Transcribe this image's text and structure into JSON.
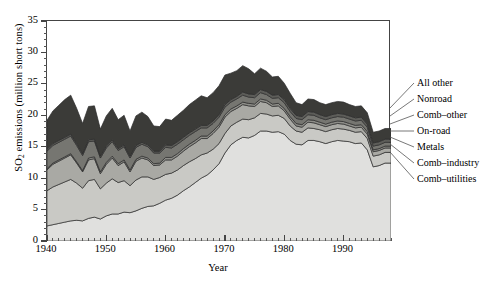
{
  "chart_data": {
    "type": "area",
    "stacked": true,
    "title": "",
    "xlabel": "Year",
    "ylabel": "SO2 emissions (million short tons)",
    "ylabel_display": "SO₂ emissions (million short tons)",
    "xlim": [
      1940,
      1998
    ],
    "ylim": [
      0,
      35
    ],
    "ytick_values": [
      0,
      5,
      10,
      15,
      20,
      25,
      30,
      35
    ],
    "ytick_labels": [
      "0",
      "5",
      "10",
      "15",
      "20",
      "25",
      "30",
      "35"
    ],
    "ytick_minor_step": 1,
    "xtick_values": [
      1940,
      1950,
      1960,
      1970,
      1980,
      1990
    ],
    "xtick_labels": [
      "1940",
      "1950",
      "1960",
      "1970",
      "1980",
      "1990"
    ],
    "xtick_minor_step": 1,
    "grid": false,
    "legend_position": "right-leader-lines",
    "x": [
      1940,
      1941,
      1942,
      1943,
      1944,
      1945,
      1946,
      1947,
      1948,
      1949,
      1950,
      1951,
      1952,
      1953,
      1954,
      1955,
      1956,
      1957,
      1958,
      1959,
      1960,
      1961,
      1962,
      1963,
      1964,
      1965,
      1966,
      1967,
      1968,
      1969,
      1970,
      1971,
      1972,
      1973,
      1974,
      1975,
      1976,
      1977,
      1978,
      1979,
      1980,
      1981,
      1982,
      1983,
      1984,
      1985,
      1986,
      1987,
      1988,
      1989,
      1990,
      1991,
      1992,
      1993,
      1994,
      1995,
      1996,
      1997,
      1998
    ],
    "series": [
      {
        "name": "Comb-utilities",
        "label": "Comb–utilities",
        "color": "#e0e0de",
        "values": [
          2.4,
          2.6,
          2.8,
          3.0,
          3.2,
          3.3,
          3.2,
          3.6,
          3.8,
          3.5,
          4.0,
          4.3,
          4.3,
          4.6,
          4.5,
          4.8,
          5.2,
          5.5,
          5.6,
          6.0,
          6.5,
          6.8,
          7.3,
          8.0,
          8.6,
          9.3,
          10.0,
          10.5,
          11.3,
          12.3,
          14.0,
          15.3,
          16.0,
          16.5,
          16.4,
          16.8,
          17.5,
          17.5,
          17.3,
          17.4,
          17.0,
          16.0,
          15.4,
          15.3,
          16.0,
          16.0,
          15.8,
          15.5,
          15.8,
          16.0,
          15.9,
          15.8,
          15.5,
          15.6,
          14.5,
          11.8,
          12.0,
          12.4,
          12.4
        ]
      },
      {
        "name": "Comb-industry",
        "label": "Comb–industry",
        "color": "#c9c9c5",
        "values": [
          5.6,
          6.0,
          6.2,
          6.4,
          6.6,
          5.9,
          5.2,
          6.0,
          6.0,
          4.8,
          5.2,
          5.6,
          5.0,
          5.0,
          4.3,
          4.9,
          5.0,
          4.7,
          4.2,
          4.1,
          4.1,
          4.0,
          4.0,
          4.0,
          4.0,
          3.8,
          3.7,
          3.5,
          3.3,
          3.2,
          3.1,
          3.0,
          2.9,
          2.9,
          2.9,
          2.8,
          2.8,
          2.7,
          2.6,
          2.6,
          2.5,
          2.3,
          2.1,
          2.0,
          2.0,
          1.9,
          1.9,
          1.9,
          1.9,
          1.9,
          1.9,
          1.8,
          1.8,
          1.8,
          1.8,
          1.7,
          1.7,
          1.7,
          1.7
        ]
      },
      {
        "name": "Metals",
        "label": "Metals",
        "color": "#a9a9a4",
        "values": [
          3.3,
          3.6,
          3.7,
          3.8,
          3.9,
          3.2,
          2.6,
          3.3,
          3.3,
          2.4,
          3.0,
          3.3,
          2.7,
          3.0,
          2.2,
          3.0,
          3.0,
          2.7,
          2.2,
          2.0,
          2.3,
          2.1,
          2.2,
          2.3,
          2.4,
          2.5,
          2.6,
          2.3,
          2.5,
          2.6,
          2.6,
          2.3,
          2.2,
          2.3,
          2.2,
          1.8,
          1.9,
          1.8,
          1.5,
          1.5,
          1.2,
          1.1,
          0.8,
          0.8,
          0.9,
          0.9,
          0.8,
          0.8,
          0.8,
          0.8,
          0.8,
          0.7,
          0.7,
          0.7,
          0.7,
          0.7,
          0.7,
          0.7,
          0.7
        ]
      },
      {
        "name": "On-road",
        "label": "On-road",
        "color": "#8e8e89",
        "values": [
          0.2,
          0.2,
          0.2,
          0.2,
          0.2,
          0.2,
          0.2,
          0.3,
          0.3,
          0.3,
          0.3,
          0.3,
          0.3,
          0.3,
          0.3,
          0.3,
          0.3,
          0.3,
          0.3,
          0.3,
          0.4,
          0.4,
          0.4,
          0.4,
          0.4,
          0.4,
          0.4,
          0.4,
          0.4,
          0.4,
          0.4,
          0.4,
          0.4,
          0.4,
          0.4,
          0.4,
          0.4,
          0.4,
          0.4,
          0.4,
          0.4,
          0.4,
          0.4,
          0.4,
          0.4,
          0.4,
          0.4,
          0.4,
          0.4,
          0.4,
          0.4,
          0.4,
          0.4,
          0.4,
          0.4,
          0.3,
          0.3,
          0.3,
          0.3
        ]
      },
      {
        "name": "Comb-other",
        "label": "Comb–other",
        "color": "#767671",
        "values": [
          2.8,
          2.8,
          2.8,
          2.8,
          2.8,
          2.6,
          2.4,
          2.6,
          2.5,
          2.2,
          2.3,
          2.3,
          2.1,
          2.1,
          1.9,
          1.9,
          1.9,
          1.8,
          1.7,
          1.6,
          1.6,
          1.5,
          1.5,
          1.4,
          1.4,
          1.4,
          1.3,
          1.3,
          1.2,
          1.2,
          1.2,
          1.1,
          1.1,
          1.1,
          1.0,
          1.0,
          1.0,
          0.9,
          0.9,
          0.9,
          0.9,
          0.8,
          0.8,
          0.8,
          0.8,
          0.8,
          0.7,
          0.7,
          0.7,
          0.7,
          0.7,
          0.7,
          0.7,
          0.7,
          0.7,
          0.6,
          0.6,
          0.6,
          0.6
        ]
      },
      {
        "name": "Nonroad",
        "label": "Nonroad",
        "color": "#5d5d59",
        "values": [
          0.3,
          0.3,
          0.3,
          0.3,
          0.3,
          0.3,
          0.3,
          0.3,
          0.3,
          0.3,
          0.3,
          0.3,
          0.3,
          0.3,
          0.3,
          0.3,
          0.3,
          0.3,
          0.3,
          0.3,
          0.4,
          0.4,
          0.4,
          0.4,
          0.4,
          0.4,
          0.4,
          0.4,
          0.4,
          0.4,
          0.4,
          0.4,
          0.4,
          0.5,
          0.5,
          0.5,
          0.5,
          0.5,
          0.5,
          0.5,
          0.5,
          0.5,
          0.5,
          0.5,
          0.5,
          0.5,
          0.5,
          0.5,
          0.5,
          0.5,
          0.5,
          0.5,
          0.5,
          0.5,
          0.5,
          0.5,
          0.5,
          0.5,
          0.5
        ]
      },
      {
        "name": "All other",
        "label": "All other",
        "color": "#3b3b38",
        "values": [
          4.6,
          5.2,
          5.6,
          6.0,
          6.2,
          5.6,
          4.8,
          5.3,
          5.3,
          4.3,
          4.8,
          5.0,
          4.6,
          4.7,
          4.0,
          4.7,
          4.8,
          4.5,
          4.0,
          3.9,
          4.1,
          4.0,
          4.2,
          4.3,
          4.5,
          4.6,
          4.7,
          4.4,
          4.5,
          4.6,
          4.7,
          4.2,
          4.1,
          4.2,
          4.0,
          3.3,
          3.4,
          3.2,
          2.9,
          2.9,
          2.6,
          2.4,
          2.0,
          1.9,
          2.0,
          2.0,
          1.9,
          1.9,
          1.9,
          1.9,
          1.9,
          1.8,
          1.8,
          1.8,
          1.8,
          1.7,
          1.7,
          1.7,
          1.7
        ]
      }
    ]
  },
  "legend": {
    "items": [
      {
        "label": "All other"
      },
      {
        "label": "Nonroad"
      },
      {
        "label": "Comb–other"
      },
      {
        "label": "On-road"
      },
      {
        "label": "Metals"
      },
      {
        "label": "Comb–industry"
      },
      {
        "label": "Comb–utilities"
      }
    ]
  },
  "axes": {
    "y_title_pre": "SO",
    "y_title_sub": "2",
    "y_title_post": " emissions (million short tons)",
    "x_title": "Year"
  }
}
